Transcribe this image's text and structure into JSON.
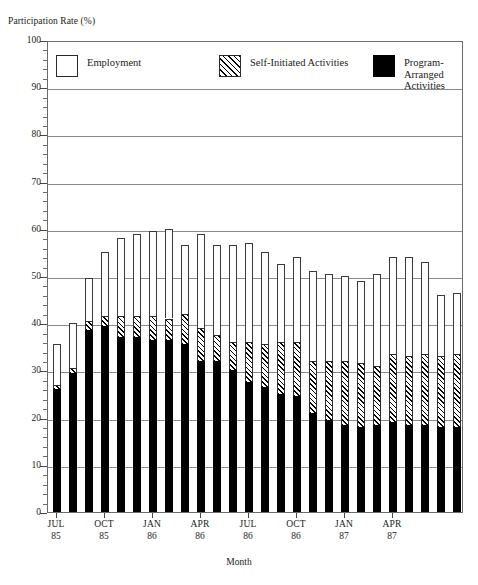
{
  "figure": {
    "ylabel_top": "Participation Rate (%)",
    "xaxis_title": "Month"
  },
  "legend": {
    "position": "inside-top",
    "items": [
      {
        "label": "Employment",
        "pattern": "solid-white",
        "swatch_name": "employment-swatch"
      },
      {
        "label": "Self-Initiated Activities",
        "pattern": "diagonal-hatch",
        "swatch_name": "self-initiated-swatch"
      },
      {
        "label": "Program-Arranged\nActivities",
        "pattern": "solid-black",
        "swatch_name": "program-arranged-swatch"
      }
    ]
  },
  "axes": {
    "y_ticks": [
      0,
      10,
      20,
      30,
      40,
      50,
      60,
      70,
      80,
      90,
      100
    ],
    "y_minor_step": 2,
    "y_min": 0,
    "y_max": 100,
    "x_tick_labels": [
      {
        "month": "JUL",
        "year": "85"
      },
      {
        "month": "OCT",
        "year": "85"
      },
      {
        "month": "JAN",
        "year": "86"
      },
      {
        "month": "APR",
        "year": "86"
      },
      {
        "month": "JUL",
        "year": "86"
      },
      {
        "month": "OCT",
        "year": "86"
      },
      {
        "month": "JAN",
        "year": "87"
      },
      {
        "month": "APR",
        "year": "87"
      }
    ]
  },
  "chart_data": {
    "type": "bar",
    "subtype": "stacked-vertical",
    "title": "",
    "xlabel": "Month",
    "ylabel": "Participation Rate (%)",
    "ylim": [
      0,
      100
    ],
    "grid": true,
    "legend_position": "inside-top",
    "categories": [
      "JUL 85",
      "AUG 85",
      "SEP 85",
      "OCT 85",
      "NOV 85",
      "DEC 85",
      "JAN 86",
      "FEB 86",
      "MAR 86",
      "APR 86",
      "MAY 86",
      "JUN 86",
      "JUL 86",
      "AUG 86",
      "SEP 86",
      "OCT 86",
      "NOV 86",
      "DEC 86",
      "JAN 87",
      "FEB 87",
      "MAR 87",
      "APR 87",
      "MAY 87",
      "JUN 87",
      "JUL 87",
      "AUG 87"
    ],
    "series": [
      {
        "name": "Program-Arranged Activities",
        "pattern": "solid-black",
        "values": [
          26.0,
          29.5,
          38.5,
          39.5,
          37.0,
          37.0,
          36.5,
          36.5,
          35.5,
          32.0,
          32.0,
          30.0,
          27.5,
          26.5,
          25.0,
          24.5,
          21.0,
          19.5,
          18.5,
          18.0,
          18.5,
          19.0,
          18.5,
          18.5,
          18.0,
          18.0
        ]
      },
      {
        "name": "Self-Initiated Activities",
        "pattern": "diagonal-hatch",
        "values": [
          1.0,
          1.0,
          2.0,
          2.0,
          4.5,
          4.5,
          5.0,
          4.5,
          6.5,
          7.0,
          5.5,
          6.0,
          8.5,
          9.0,
          11.0,
          11.5,
          11.0,
          12.5,
          13.5,
          13.5,
          12.5,
          14.5,
          14.5,
          15.0,
          15.0,
          15.5
        ]
      },
      {
        "name": "Employment",
        "pattern": "solid-white",
        "values": [
          8.5,
          9.5,
          9.0,
          13.5,
          16.5,
          17.5,
          18.0,
          19.0,
          14.5,
          20.0,
          19.0,
          20.5,
          21.0,
          19.5,
          16.5,
          18.0,
          19.0,
          18.5,
          18.0,
          17.5,
          19.5,
          20.5,
          21.0,
          19.5,
          13.0,
          13.0
        ]
      }
    ],
    "totals": [
      35.5,
      40.0,
      49.5,
      55.0,
      58.0,
      59.0,
      59.5,
      60.0,
      56.5,
      59.0,
      56.5,
      56.5,
      57.0,
      55.0,
      52.5,
      54.0,
      51.0,
      50.5,
      50.0,
      49.0,
      50.5,
      54.0,
      54.0,
      53.0,
      46.0,
      46.5
    ]
  }
}
